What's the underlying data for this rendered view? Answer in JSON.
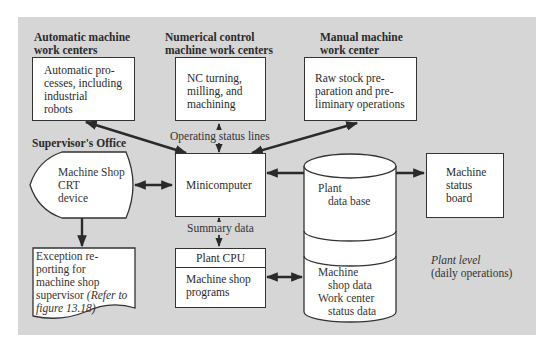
{
  "headings": {
    "automatic": [
      "Automatic machine",
      "work centers"
    ],
    "nc": [
      "Numerical control",
      "machine work centers"
    ],
    "manual": [
      "Manual machine",
      "work center"
    ],
    "supervisor": "Supervisor's Office"
  },
  "nodes": {
    "automatic": [
      "Automatic pro-",
      "cesses, including",
      "industrial",
      "robots"
    ],
    "nc": [
      "NC turning,",
      "milling, and",
      "machining"
    ],
    "manual": [
      "Raw stock pre-",
      "paration and pre-",
      "liminary operations"
    ],
    "crt": [
      "Machine Shop",
      "CRT",
      "device"
    ],
    "minicomputer": "Minicomputer",
    "status_board": [
      "Machine",
      "status",
      "board"
    ],
    "exception": {
      "lines": [
        "Exception re-",
        "porting for",
        "machine shop",
        "supervisor "
      ],
      "italic_a": "(Refer to",
      "italic_b": "figure 13.18)"
    },
    "plant_cpu": {
      "title": "Plant CPU",
      "body": [
        "Machine shop",
        "programs"
      ]
    },
    "database": {
      "top": [
        "Plant",
        "data base"
      ],
      "bottom": [
        "Machine",
        "shop data",
        "Work center",
        "status data"
      ]
    }
  },
  "edge_labels": {
    "operating_status": "Operating status lines",
    "summary": "Summary data"
  },
  "annotation": {
    "level": "Plant level",
    "sub": "(daily operations)"
  },
  "colors": {
    "panel": "#d6d6d6",
    "box": "#ffffff",
    "line": "#2a2a2a"
  }
}
